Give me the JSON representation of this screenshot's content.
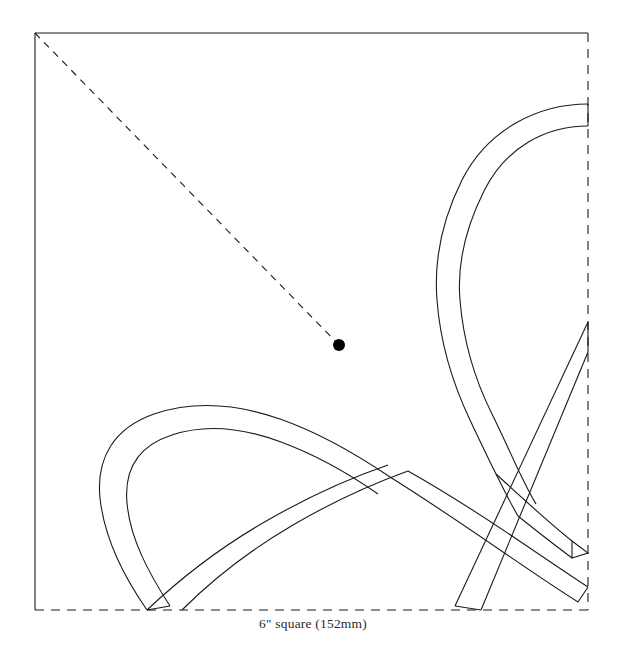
{
  "document": {
    "kind": "quilting-pattern-template",
    "title": "6\" square (152mm)",
    "caption": "6\" square (152mm)",
    "background_color": "#ffffff",
    "ink_color": "#1a1a1a",
    "caption_color": "#2b2b2b"
  },
  "block": {
    "label": "6\" square (152mm)",
    "size_inches": 6,
    "size_mm": 152,
    "bounds": {
      "left": 35,
      "top": 33,
      "right": 588,
      "bottom": 610
    },
    "edges": {
      "top": {
        "name": "top-edge",
        "style": "solid"
      },
      "left": {
        "name": "left-edge",
        "style": "solid"
      },
      "right": {
        "name": "right-edge",
        "style": "dashed"
      },
      "bottom": {
        "name": "bottom-edge",
        "style": "dashed"
      }
    },
    "stroke_width": 1.1,
    "dash_pattern": "9 7"
  },
  "placement_guide": {
    "name": "diagonal-placement-line",
    "style": "dashed",
    "dash_pattern": "7 6",
    "stroke_width": 1.1,
    "from": {
      "x": 35,
      "y": 33
    },
    "to": {
      "x": 339,
      "y": 345
    },
    "marker": {
      "name": "center-registration-dot",
      "x": 339,
      "y": 345,
      "radius": 6,
      "fill": "#000000"
    }
  },
  "ribbons": {
    "stroke_width": 1.1,
    "band_width": 22,
    "paths": [
      {
        "id": "upper-right-arc-outer",
        "name": "upper-right-arc-outer-edge",
        "d": "M 588 104 C 540 104 488 128 462 180 C 440 224 434 262 437 300 C 440 340 452 382 470 420"
      },
      {
        "id": "upper-right-arc-inner",
        "name": "upper-right-arc-inner-edge",
        "d": "M 588 126 C 546 126 506 147 484 191 C 464 231 457 265 460 300 C 463 338 474 378 492 414"
      },
      {
        "id": "upper-right-arc-lower-outer",
        "name": "upper-right-band-lower-outer-edge",
        "d": "M 470 420 C 478 437 487 456 496 474 C 505 492 512 506 518 516"
      },
      {
        "id": "upper-right-arc-lower-inner",
        "name": "upper-right-band-lower-inner-edge",
        "d": "M 492 414 C 500 430 508 448 516 465 C 524 482 530 494 536 504"
      },
      {
        "id": "left-loop-outer",
        "name": "left-loop-outer-edge",
        "d": "M 147 610 C 122 574 104 536 100 498 C 96 458 114 428 154 414 C 196 400 240 405 280 419 C 320 433 356 454 390 477"
      },
      {
        "id": "left-loop-inner",
        "name": "left-loop-inner-edge",
        "d": "M 170 606 C 148 572 130 538 127 503 C 124 470 138 446 172 435 C 208 423 246 429 281 442 C 316 455 348 473 378 494"
      },
      {
        "id": "lower-left-rise-outer",
        "name": "lower-left-rising-band-outer-edge",
        "d": "M 182 610 C 214 578 252 549 293 525 C 334 501 372 484 408 471"
      },
      {
        "id": "lower-left-rise-inner",
        "name": "lower-left-rising-band-inner-edge",
        "d": "M 147 610 C 183 576 224 545 268 520 C 310 496 350 478 388 465"
      },
      {
        "id": "ascending-band-outer",
        "name": "ascending-diagonal-outer-edge",
        "d": "M 390 477 C 430 502 468 528 503 552 C 538 576 562 592 578 602"
      },
      {
        "id": "ascending-band-inner",
        "name": "ascending-diagonal-inner-edge",
        "d": "M 408 471 C 447 493 484 517 518 540 C 552 563 574 578 588 587"
      },
      {
        "id": "descending-band-outer",
        "name": "descending-diagonal-outer-edge",
        "d": "M 588 322 L 455 606"
      },
      {
        "id": "descending-band-inner",
        "name": "descending-diagonal-inner-edge",
        "d": "M 588 352 L 481 610"
      },
      {
        "id": "corner-band-outer",
        "name": "lower-right-corner-band-outer-edge",
        "d": "M 496 474 C 520 496 548 522 572 541"
      },
      {
        "id": "corner-band-inner",
        "name": "lower-right-corner-band-inner-edge",
        "d": "M 518 516 C 534 529 556 546 572 558"
      }
    ],
    "end_caps": [
      {
        "name": "upper-right-band-cap-top",
        "d": "M 588 104 L 588 126"
      },
      {
        "name": "descending-band-cap-right",
        "d": "M 588 322 L 588 352"
      },
      {
        "name": "corner-band-cap-right",
        "d": "M 572 541 L 588 553 L 572 558 Z"
      },
      {
        "name": "ascending-band-cap-right",
        "d": "M 578 602 L 588 587"
      },
      {
        "name": "descending-band-cap-bottom",
        "d": "M 455 606 L 481 610"
      },
      {
        "name": "left-loop-cap-bottom",
        "d": "M 147 610 L 170 606"
      }
    ]
  }
}
